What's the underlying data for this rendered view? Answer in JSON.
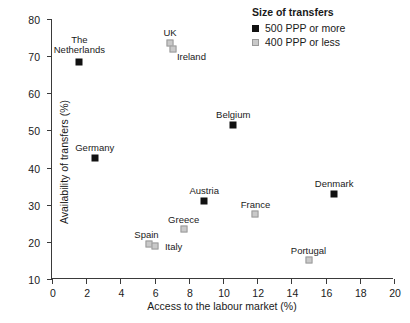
{
  "chart_data": {
    "type": "scatter",
    "title": "",
    "xlabel": "Access to the labour market (%)",
    "ylabel": "Availability of transfers (%)",
    "xlim": [
      0,
      20
    ],
    "ylim": [
      10,
      80
    ],
    "xticks": [
      "0",
      "2",
      "4",
      "6",
      "8",
      "10",
      "12",
      "14",
      "16",
      "18",
      "20"
    ],
    "yticks": [
      "10",
      "20",
      "30",
      "40",
      "50",
      "60",
      "70",
      "80"
    ],
    "grid": false,
    "legend_position": "top-right",
    "series": [
      {
        "name": "500 PPP or more",
        "color": "#111111",
        "marker": "filled-square",
        "points": [
          {
            "label": "The\nNetherlands",
            "x": 1.6,
            "y": 68.5,
            "label_dx": 0,
            "label_dy": -27
          },
          {
            "label": "Germany",
            "x": 2.5,
            "y": 42.5,
            "label_dx": 0,
            "label_dy": -15
          },
          {
            "label": "Austria",
            "x": 8.9,
            "y": 31.0,
            "label_dx": 0,
            "label_dy": -15
          },
          {
            "label": "Belgium",
            "x": 10.6,
            "y": 51.5,
            "label_dx": 0,
            "label_dy": -15
          },
          {
            "label": "Denmark",
            "x": 16.5,
            "y": 33.0,
            "label_dx": 0,
            "label_dy": -15
          }
        ]
      },
      {
        "name": "400 PPP or less",
        "color": "#c9c9c9",
        "marker": "open-square",
        "points": [
          {
            "label": "UK",
            "x": 6.9,
            "y": 73.5,
            "label_dx": 0,
            "label_dy": -15
          },
          {
            "label": "Ireland",
            "x": 7.1,
            "y": 72.0,
            "label_dx": 18,
            "label_dy": 3
          },
          {
            "label": "Greece",
            "x": 7.7,
            "y": 23.5,
            "label_dx": 0,
            "label_dy": -14
          },
          {
            "label": "Spain",
            "x": 5.7,
            "y": 19.5,
            "label_dx": -3,
            "label_dy": -14
          },
          {
            "label": "Italy",
            "x": 6.0,
            "y": 18.8,
            "label_dx": 19,
            "label_dy": -4
          },
          {
            "label": "France",
            "x": 11.9,
            "y": 27.5,
            "label_dx": 0,
            "label_dy": -14
          },
          {
            "label": "Portugal",
            "x": 15.0,
            "y": 15.0,
            "label_dx": 0,
            "label_dy": -14
          }
        ]
      }
    ]
  },
  "legend": {
    "title": "Size of transfers",
    "entries": [
      {
        "label": "500 PPP or more",
        "swatch": "dark"
      },
      {
        "label": "400 PPP or less",
        "swatch": "light"
      }
    ]
  },
  "axes": {
    "x_title": "Access to the labour market (%)",
    "y_title": "Availability of transfers (%)"
  }
}
